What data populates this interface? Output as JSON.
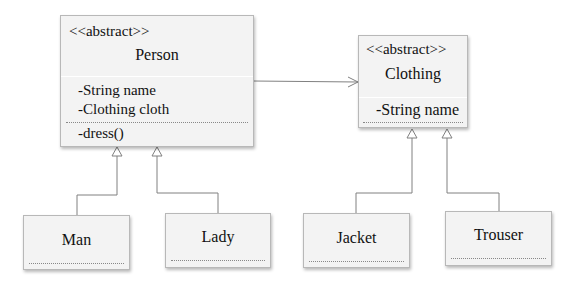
{
  "classes": {
    "person": {
      "stereotype": "<<abstract>>",
      "name": "Person",
      "attributes": [
        "-String name",
        "-Clothing cloth"
      ],
      "methods": [
        "-dress()"
      ]
    },
    "clothing": {
      "stereotype": "<<abstract>>",
      "name": "Clothing",
      "attributes": [
        "-String name"
      ],
      "methods": []
    },
    "man": {
      "name": "Man"
    },
    "lady": {
      "name": "Lady"
    },
    "jacket": {
      "name": "Jacket"
    },
    "trouser": {
      "name": "Trouser"
    }
  },
  "relations": [
    {
      "from": "Person",
      "to": "Clothing",
      "type": "association"
    },
    {
      "from": "Man",
      "to": "Person",
      "type": "generalization"
    },
    {
      "from": "Lady",
      "to": "Person",
      "type": "generalization"
    },
    {
      "from": "Jacket",
      "to": "Clothing",
      "type": "generalization"
    },
    {
      "from": "Trouser",
      "to": "Clothing",
      "type": "generalization"
    }
  ],
  "colors": {
    "box_fill": "#f3f3f3",
    "border": "#b8b8b8",
    "line": "#808080"
  }
}
